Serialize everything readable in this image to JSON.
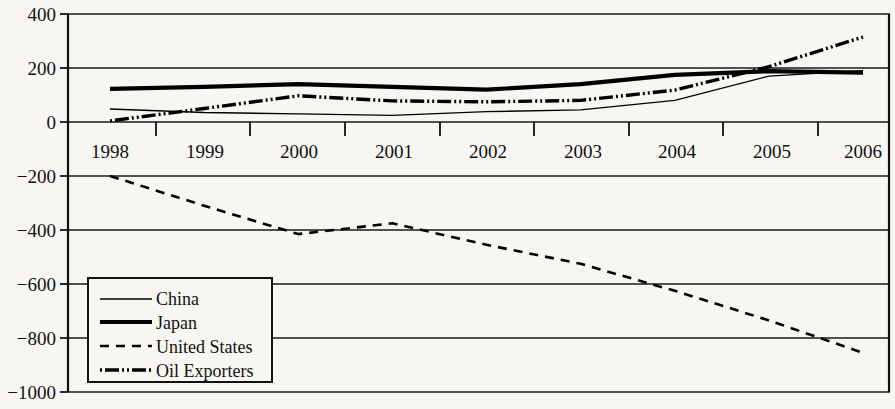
{
  "chart_data": {
    "type": "line",
    "title": "",
    "subtitle": "",
    "xlabel": "",
    "ylabel": "",
    "x": [
      1998,
      1999,
      2000,
      2001,
      2002,
      2003,
      2004,
      2005,
      2006
    ],
    "xtick_labels": [
      "1998",
      "1999",
      "2000",
      "2001",
      "2002",
      "2003",
      "2004",
      "2005",
      "2006"
    ],
    "ytick_labels": [
      "400",
      "200",
      "0",
      "−200",
      "−400",
      "−600",
      "−800",
      "−1000"
    ],
    "ytick_values": [
      400,
      200,
      0,
      -200,
      -400,
      -600,
      -800,
      -1000
    ],
    "ylim": [
      -1000,
      400
    ],
    "xlim": [
      1997.6,
      2006.4
    ],
    "grid": true,
    "legend_position": "lower-left-inside",
    "series": [
      {
        "name": "China",
        "style": "solid-thin",
        "stroke_width": 1.3,
        "color": "#000000",
        "values": [
          48,
          35,
          30,
          25,
          38,
          45,
          80,
          170,
          190
        ]
      },
      {
        "name": "Japan",
        "style": "solid-thick",
        "stroke_width": 4.2,
        "color": "#000000",
        "values": [
          123,
          130,
          140,
          130,
          120,
          140,
          175,
          188,
          183
        ]
      },
      {
        "name": "United States",
        "style": "dashed",
        "stroke_width": 2.6,
        "color": "#000000",
        "values": [
          -200,
          -310,
          -415,
          -375,
          -455,
          -525,
          -625,
          -735,
          -855
        ]
      },
      {
        "name": "Oil Exporters",
        "style": "dash-dot-dot",
        "stroke_width": 3.4,
        "color": "#000000",
        "values": [
          4,
          50,
          97,
          78,
          75,
          80,
          118,
          205,
          315
        ]
      }
    ]
  },
  "legend": {
    "items": [
      {
        "label": "China"
      },
      {
        "label": "Japan"
      },
      {
        "label": "United States"
      },
      {
        "label": "Oil Exporters"
      }
    ]
  }
}
